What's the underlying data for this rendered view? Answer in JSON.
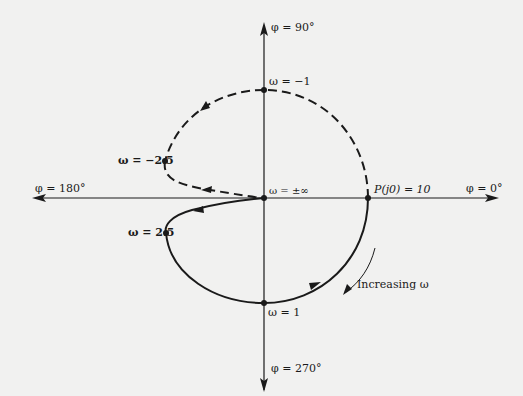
{
  "diagram": {
    "type": "polar-plot",
    "colors": {
      "background": "#f1f1f0",
      "ink": "#1a1a1a"
    },
    "axes": {
      "phi_0": "φ = 0°",
      "phi_90": "φ = 90°",
      "phi_180": "φ = 180°",
      "phi_270": "φ = 270°"
    },
    "points": {
      "w_neg1": "ω = −1",
      "w_neg2_5": "ω = −2.5",
      "w_pm_inf": "ω = ±∞",
      "w_2_5": "ω = 2.5",
      "w_1": "ω = 1",
      "p_j0": "P(j0) = 10"
    },
    "annotation": {
      "increasing": "Increasing ω"
    },
    "legend": {
      "solid_curve": "positive ω (0 → +∞)",
      "dashed_curve": "negative ω (−∞ → 0)"
    }
  }
}
